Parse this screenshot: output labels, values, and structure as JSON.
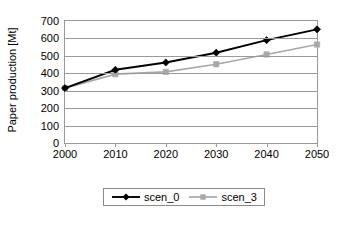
{
  "chart_data": {
    "type": "line",
    "title": "",
    "xlabel": "",
    "ylabel": "Paper production [Mt]",
    "x": [
      2000,
      2010,
      2020,
      2030,
      2040,
      2050
    ],
    "xtick_labels": [
      "2000",
      "2010",
      "2020",
      "2030",
      "2040",
      "2050"
    ],
    "ytick_labels": [
      "700",
      "600",
      "500",
      "400",
      "300",
      "200",
      "100",
      "0"
    ],
    "yticks": [
      700,
      600,
      500,
      400,
      300,
      200,
      100,
      0
    ],
    "ylim": [
      0,
      700
    ],
    "xlim": [
      2000,
      2050
    ],
    "grid": "horizontal",
    "legend_position": "bottom-center",
    "series": [
      {
        "name": "scen_0",
        "values": [
          315,
          420,
          462,
          518,
          590,
          652
        ],
        "color": "#000000",
        "marker": "diamond"
      },
      {
        "name": "scen_3",
        "values": [
          315,
          395,
          408,
          452,
          508,
          565
        ],
        "color": "#a8a8a8",
        "marker": "square"
      }
    ]
  },
  "legend": {
    "entries": [
      {
        "label": "scen_0"
      },
      {
        "label": "scen_3"
      }
    ]
  }
}
